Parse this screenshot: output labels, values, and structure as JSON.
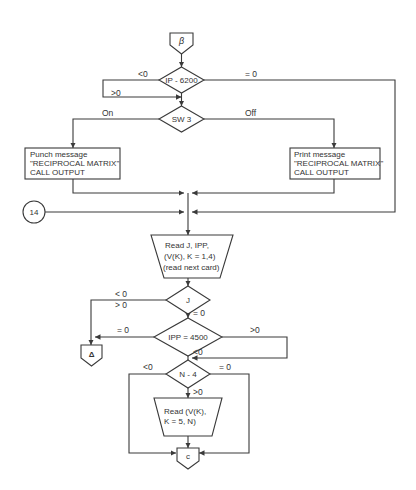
{
  "connectors": {
    "entry": "β",
    "circle14": "14",
    "delta": "Δ",
    "exit": "c"
  },
  "decisions": {
    "ip": {
      "text": "IP - 6200",
      "lt": "<0",
      "gt": ">0",
      "eq": "= 0"
    },
    "sw3": {
      "text": "SW 3",
      "on": "On",
      "off": "Off"
    },
    "j": {
      "text": "J",
      "lt": "< 0",
      "gt": "> 0",
      "eq": "= 0"
    },
    "ipp": {
      "text": "IPP = 4500",
      "eq": "= 0",
      "gt": ">0",
      "lt": "<0"
    },
    "n4": {
      "text": "N - 4",
      "lt": "<0",
      "eq": "= 0",
      "gt": ">0"
    }
  },
  "processes": {
    "punch": {
      "line1": "Punch message",
      "line2": "\"RECIPROCAL MATRIX\"",
      "line3": "CALL OUTPUT"
    },
    "print": {
      "line1": "Print message",
      "line2": "\"RECIPROCAL MATRIX\"",
      "line3": "CALL OUTPUT"
    }
  },
  "inputs": {
    "read1": {
      "line1": "Read J, IPP,",
      "line2": "(V(K), K = 1,4)",
      "line3": "(read next card)"
    },
    "read2": {
      "line1": "Read (V(K),",
      "line2": "K = 5, N)"
    }
  },
  "colors": {
    "line": "#3a3a3a",
    "background": "#ffffff"
  }
}
